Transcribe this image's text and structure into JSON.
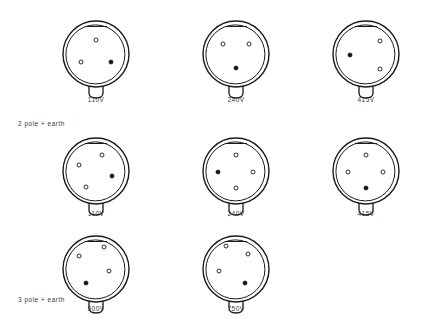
{
  "diagram": {
    "style": {
      "outline_color": "#1a1a1a",
      "pin_open_color": "#ffffff",
      "pin_filled_color": "#111111",
      "background": "#ffffff"
    },
    "group_labels": [
      {
        "text": "2 pole + earth",
        "x": 18,
        "y": 120
      },
      {
        "text": "3 pole + earth",
        "x": 18,
        "y": 296
      }
    ],
    "rows": [
      {
        "name": "row-2-pole-earth-top",
        "pin_count": 3,
        "y": 14,
        "label_y": 96,
        "connectors": [
          {
            "name": "connector-110v-3pin",
            "voltage": "110V",
            "x": 58,
            "pins": [
              {
                "name": "pin-top",
                "cx": 38,
                "cy": 26,
                "filled": false
              },
              {
                "name": "pin-lower-left",
                "cx": 23,
                "cy": 48,
                "filled": false
              },
              {
                "name": "pin-lower-right",
                "cx": 53,
                "cy": 48,
                "filled": true
              }
            ]
          },
          {
            "name": "connector-240v-3pin",
            "voltage": "240V",
            "x": 198,
            "pins": [
              {
                "name": "pin-top-left",
                "cx": 25,
                "cy": 30,
                "filled": false
              },
              {
                "name": "pin-top-right",
                "cx": 51,
                "cy": 30,
                "filled": false
              },
              {
                "name": "pin-bottom",
                "cx": 38,
                "cy": 54,
                "filled": true
              }
            ]
          },
          {
            "name": "connector-415v-3pin",
            "voltage": "415V",
            "x": 328,
            "pins": [
              {
                "name": "pin-upper-right",
                "cx": 52,
                "cy": 27,
                "filled": false
              },
              {
                "name": "pin-left",
                "cx": 22,
                "cy": 41,
                "filled": true
              },
              {
                "name": "pin-lower-right",
                "cx": 52,
                "cy": 55,
                "filled": false
              }
            ]
          }
        ]
      },
      {
        "name": "row-2-pole-earth-bottom",
        "pin_count": 4,
        "y": 131,
        "label_y": 210,
        "connectors": [
          {
            "name": "connector-110v-4pin",
            "voltage": "110V",
            "x": 58,
            "pins": [
              {
                "name": "pin-top",
                "cx": 44,
                "cy": 24,
                "filled": false
              },
              {
                "name": "pin-left",
                "cx": 21,
                "cy": 34,
                "filled": false
              },
              {
                "name": "pin-right",
                "cx": 54,
                "cy": 45,
                "filled": true
              },
              {
                "name": "pin-bottom-left",
                "cx": 28,
                "cy": 56,
                "filled": false
              }
            ]
          },
          {
            "name": "connector-240v-4pin",
            "voltage": "240V",
            "x": 198,
            "pins": [
              {
                "name": "pin-top",
                "cx": 38,
                "cy": 24,
                "filled": false
              },
              {
                "name": "pin-left",
                "cx": 20,
                "cy": 41,
                "filled": true
              },
              {
                "name": "pin-right",
                "cx": 55,
                "cy": 41,
                "filled": false
              },
              {
                "name": "pin-bottom",
                "cx": 38,
                "cy": 57,
                "filled": false
              }
            ]
          },
          {
            "name": "connector-415v-4pin",
            "voltage": "415V",
            "x": 328,
            "pins": [
              {
                "name": "pin-top",
                "cx": 38,
                "cy": 24,
                "filled": false
              },
              {
                "name": "pin-left",
                "cx": 20,
                "cy": 41,
                "filled": false
              },
              {
                "name": "pin-right",
                "cx": 55,
                "cy": 41,
                "filled": false
              },
              {
                "name": "pin-bottom",
                "cx": 38,
                "cy": 57,
                "filled": true
              }
            ]
          }
        ]
      },
      {
        "name": "row-3-pole-earth",
        "pin_count": 4,
        "y": 229,
        "label_y": 305,
        "connectors": [
          {
            "name": "connector-500v-5pin",
            "voltage": "500V",
            "x": 58,
            "pins": [
              {
                "name": "pin-top-right",
                "cx": 46,
                "cy": 18,
                "filled": false
              },
              {
                "name": "pin-upper-left",
                "cx": 21,
                "cy": 27,
                "filled": false
              },
              {
                "name": "pin-right",
                "cx": 51,
                "cy": 42,
                "filled": false
              },
              {
                "name": "pin-lower-left",
                "cx": 28,
                "cy": 54,
                "filled": true
              }
            ]
          },
          {
            "name": "connector-750v-5pin",
            "voltage": "750V",
            "x": 198,
            "pins": [
              {
                "name": "pin-top-left",
                "cx": 28,
                "cy": 17,
                "filled": false
              },
              {
                "name": "pin-upper-right",
                "cx": 50,
                "cy": 25,
                "filled": false
              },
              {
                "name": "pin-left",
                "cx": 21,
                "cy": 42,
                "filled": false
              },
              {
                "name": "pin-lower-right",
                "cx": 47,
                "cy": 54,
                "filled": true
              }
            ]
          }
        ]
      }
    ]
  }
}
